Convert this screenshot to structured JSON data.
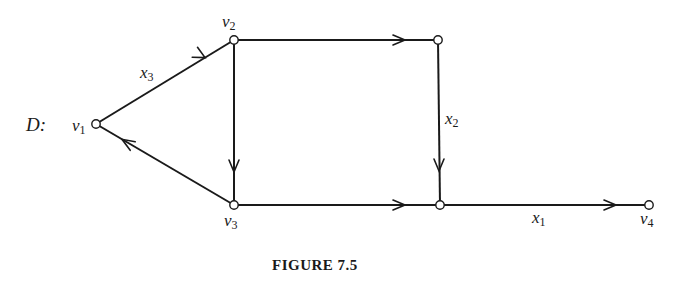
{
  "figure": {
    "graph_name": "D:",
    "caption": "FIGURE 7.5"
  },
  "nodes": [
    {
      "id": "v1",
      "label": "v",
      "sub": "1",
      "x": 96,
      "y": 124
    },
    {
      "id": "v2",
      "label": "v",
      "sub": "2",
      "x": 234,
      "y": 40
    },
    {
      "id": "v3",
      "label": "v",
      "sub": "3",
      "x": 234,
      "y": 205
    },
    {
      "id": "n_tr",
      "label": "",
      "sub": "",
      "x": 438,
      "y": 40
    },
    {
      "id": "n_br",
      "label": "",
      "sub": "",
      "x": 440,
      "y": 205
    },
    {
      "id": "v4",
      "label": "v",
      "sub": "4",
      "x": 649,
      "y": 205
    }
  ],
  "edges": [
    {
      "from": "v1",
      "to": "v2",
      "label": "x",
      "sub": "3"
    },
    {
      "from": "v3",
      "to": "v1",
      "label": "",
      "sub": ""
    },
    {
      "from": "v2",
      "to": "v3",
      "label": "",
      "sub": ""
    },
    {
      "from": "v2",
      "to": "n_tr",
      "label": "",
      "sub": ""
    },
    {
      "from": "n_tr",
      "to": "n_br",
      "label": "x",
      "sub": "2"
    },
    {
      "from": "v3",
      "to": "n_br",
      "label": "",
      "sub": ""
    },
    {
      "from": "n_br",
      "to": "v4",
      "label": "x",
      "sub": "1"
    }
  ],
  "labels": {
    "v1": {
      "main": "v",
      "sub": "1"
    },
    "v2": {
      "main": "v",
      "sub": "2"
    },
    "v3": {
      "main": "v",
      "sub": "3"
    },
    "v4": {
      "main": "v",
      "sub": "4"
    },
    "x1": {
      "main": "x",
      "sub": "1"
    },
    "x2": {
      "main": "x",
      "sub": "2"
    },
    "x3": {
      "main": "x",
      "sub": "3"
    }
  },
  "colors": {
    "stroke": "#1a1a1a",
    "background": "#ffffff",
    "node_fill": "#ffffff"
  }
}
